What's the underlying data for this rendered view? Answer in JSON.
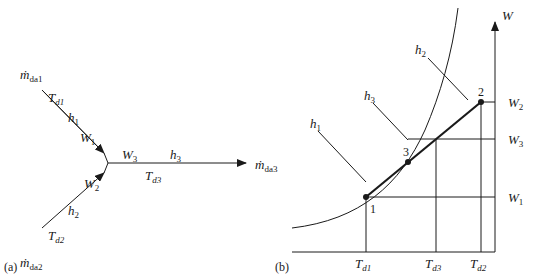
{
  "figure": {
    "panel_a": {
      "caption": "(a)",
      "inlet1": {
        "mass_flow": "ṁ",
        "mass_flow_sub": "da1",
        "temp": "T",
        "temp_sub": "d1",
        "enthalpy": "h",
        "enthalpy_sub": "1",
        "humidity": "W",
        "humidity_sub": "1"
      },
      "inlet2": {
        "mass_flow": "ṁ",
        "mass_flow_sub": "da2",
        "temp": "T",
        "temp_sub": "d2",
        "enthalpy": "h",
        "enthalpy_sub": "2",
        "humidity": "W",
        "humidity_sub": "2"
      },
      "outlet": {
        "mass_flow": "ṁ",
        "mass_flow_sub": "da3",
        "temp": "T",
        "temp_sub": "d3",
        "enthalpy": "h",
        "enthalpy_sub": "3",
        "humidity": "W",
        "humidity_sub": "3"
      }
    },
    "panel_b": {
      "caption": "(b)",
      "y_axis_label": "W",
      "points": [
        {
          "label": "1"
        },
        {
          "label": "2"
        },
        {
          "label": "3"
        }
      ],
      "enthalpy_lines": [
        {
          "h": "h",
          "sub": "1"
        },
        {
          "h": "h",
          "sub": "2"
        },
        {
          "h": "h",
          "sub": "3"
        }
      ],
      "right_labels": [
        {
          "w": "W",
          "sub": "2"
        },
        {
          "w": "W",
          "sub": "3"
        },
        {
          "w": "W",
          "sub": "1"
        }
      ],
      "bottom_labels": [
        {
          "t": "T",
          "sub": "d1"
        },
        {
          "t": "T",
          "sub": "d3"
        },
        {
          "t": "T",
          "sub": "d2"
        }
      ]
    }
  }
}
